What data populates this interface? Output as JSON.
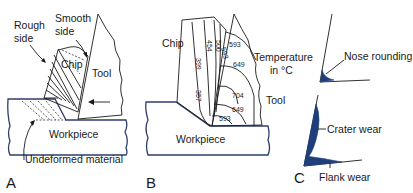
{
  "figure": {
    "colors": {
      "outline": "#2c3e6b",
      "ink": "#1a1a1a",
      "wear_fill": "#1f3f7a",
      "background": "#ffffff"
    },
    "panels": [
      {
        "id": "A",
        "letter": "A",
        "labels": {
          "rough_side_1": "Rough",
          "rough_side_2": "side",
          "smooth_side_1": "Smooth",
          "smooth_side_2": "side",
          "chip": "Chip",
          "tool": "Tool",
          "workpiece": "Workpiece",
          "undeformed": "Undeformed material"
        }
      },
      {
        "id": "B",
        "letter": "B",
        "labels": {
          "chip": "Chip",
          "temperature_1": "Temperature",
          "temperature_2": "in °C",
          "tool": "Tool",
          "workpiece": "Workpiece"
        },
        "isotherms": [
          "399",
          "357",
          "454",
          "500",
          "593",
          "593",
          "649",
          "704",
          "649",
          "593"
        ]
      },
      {
        "id": "C",
        "letter": "C",
        "labels": {
          "nose_rounding": "Nose rounding",
          "crater_wear": "Crater wear",
          "flank_wear": "Flank wear"
        }
      }
    ]
  }
}
